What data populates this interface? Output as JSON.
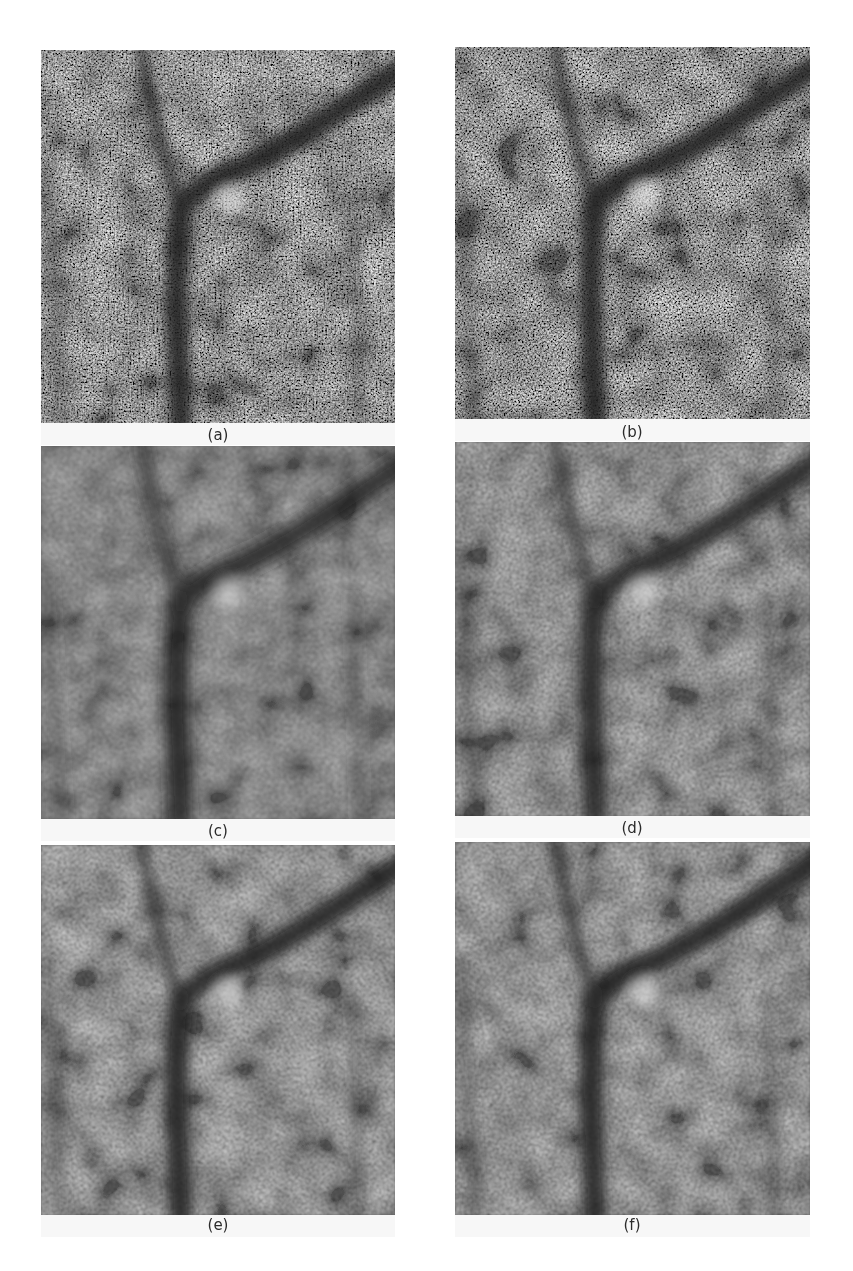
{
  "figure": {
    "panels": [
      {
        "id": "a",
        "caption": "(a)",
        "x": 41,
        "y": 50,
        "w": 354,
        "h": 373,
        "cap_x": 188,
        "cap_y": 426,
        "blur": 0.6,
        "contrast": 1.0
      },
      {
        "id": "b",
        "caption": "(b)",
        "x": 455,
        "y": 47,
        "w": 355,
        "h": 372,
        "cap_x": 602,
        "cap_y": 423,
        "blur": 0.6,
        "contrast": 1.0
      },
      {
        "id": "c",
        "caption": "(c)",
        "x": 41,
        "y": 446,
        "w": 354,
        "h": 373,
        "cap_x": 188,
        "cap_y": 822,
        "blur": 1.6,
        "contrast": 0.8
      },
      {
        "id": "d",
        "caption": "(d)",
        "x": 455,
        "y": 442,
        "w": 355,
        "h": 374,
        "cap_x": 602,
        "cap_y": 819,
        "blur": 1.2,
        "contrast": 0.9
      },
      {
        "id": "e",
        "caption": "(e)",
        "x": 41,
        "y": 845,
        "w": 354,
        "h": 370,
        "cap_x": 188,
        "cap_y": 1216,
        "blur": 1.0,
        "contrast": 0.95
      },
      {
        "id": "f",
        "caption": "(f)",
        "x": 455,
        "y": 842,
        "w": 355,
        "h": 373,
        "cap_x": 602,
        "cap_y": 1216,
        "blur": 1.0,
        "contrast": 0.95
      }
    ]
  }
}
